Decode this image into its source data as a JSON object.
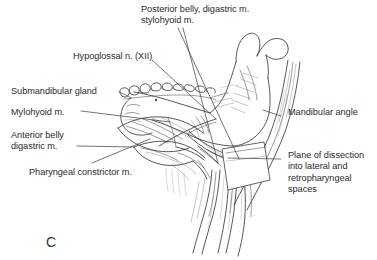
{
  "figure": {
    "panel_letter": "C",
    "background_color": "#ffffff",
    "ink_color": "#3a3a3a",
    "text_color": "#2b2b2b",
    "width": 377,
    "height": 260,
    "type": "anatomical-line-illustration"
  },
  "labels": [
    {
      "id": "posterior-belly",
      "text": "Posterior belly, digastric m.\nstylohyoid m.",
      "x": 141,
      "y": 4,
      "align": "left"
    },
    {
      "id": "hypoglossal",
      "text": "Hypoglossal n. (XII)",
      "x": 73,
      "y": 51,
      "align": "left"
    },
    {
      "id": "submandibular-gland",
      "text": "Submandibular gland",
      "x": 11,
      "y": 86,
      "align": "left"
    },
    {
      "id": "mylohyoid",
      "text": "Mylohyoid m.",
      "x": 11,
      "y": 107,
      "align": "left"
    },
    {
      "id": "anterior-belly",
      "text": "Anterior belly\ndigastric m.",
      "x": 11,
      "y": 130,
      "align": "left"
    },
    {
      "id": "pharyngeal-constrictor",
      "text": "Pharyngeal constrictor m.",
      "x": 29,
      "y": 167,
      "align": "left"
    },
    {
      "id": "mandibular-angle",
      "text": "Mandibular angle",
      "x": 283,
      "y": 112,
      "align": "left"
    },
    {
      "id": "plane-of-dissection",
      "text": "Plane of dissection\ninto lateral and\nretropharyngeal\nspaces",
      "x": 283,
      "y": 155,
      "align": "left"
    }
  ],
  "leader_lines": [
    {
      "id": "leader-posterior-belly-a",
      "from": [
        178,
        28
      ],
      "to": [
        239,
        159
      ]
    },
    {
      "id": "leader-posterior-belly-b",
      "from": [
        183,
        28
      ],
      "to": [
        218,
        163
      ]
    },
    {
      "id": "leader-hypoglossal",
      "from": [
        152,
        60
      ],
      "to": [
        216,
        119
      ]
    },
    {
      "id": "leader-submandibular-gland",
      "from": [
        119,
        92
      ],
      "to": [
        131,
        98
      ]
    },
    {
      "id": "leader-mylohyoid",
      "from": [
        81,
        111
      ],
      "to": [
        170,
        122
      ]
    },
    {
      "id": "leader-anterior-belly",
      "from": [
        77,
        146
      ],
      "to": [
        134,
        147
      ]
    },
    {
      "id": "leader-pharyngeal-constrictor",
      "from": [
        92,
        163
      ],
      "to": [
        148,
        140
      ]
    },
    {
      "id": "leader-mandibular-angle",
      "from": [
        281,
        116
      ],
      "to": [
        264,
        110
      ]
    },
    {
      "id": "leader-plane-of-dissection",
      "from": [
        281,
        159
      ],
      "to": [
        228,
        158
      ]
    }
  ]
}
